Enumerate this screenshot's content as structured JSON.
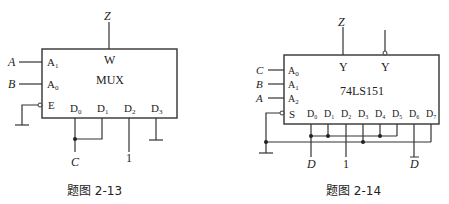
{
  "figures": [
    {
      "caption": "题图 2-13",
      "chip_label": "MUX",
      "output_pin": "W",
      "output_signal": "Z",
      "select_pins": [
        {
          "pin": "A",
          "sub": "1",
          "signal": "A"
        },
        {
          "pin": "A",
          "sub": "0",
          "signal": "B"
        }
      ],
      "enable_pin": "E",
      "data_pins": [
        {
          "pin": "D",
          "sub": "0"
        },
        {
          "pin": "D",
          "sub": "1"
        },
        {
          "pin": "D",
          "sub": "2"
        },
        {
          "pin": "D",
          "sub": "3"
        }
      ],
      "inputs": {
        "d01": "C",
        "d2": "1"
      }
    },
    {
      "caption": "题图 2-14",
      "chip_label": "74LS151",
      "output_pins": [
        "Y",
        "Y"
      ],
      "output_signal": "Z",
      "select_pins": [
        {
          "pin": "A",
          "sub": "0",
          "signal": "C"
        },
        {
          "pin": "A",
          "sub": "1",
          "signal": "B"
        },
        {
          "pin": "A",
          "sub": "2",
          "signal": "A"
        }
      ],
      "enable_pin": "S",
      "data_pins": [
        {
          "pin": "D",
          "sub": "0"
        },
        {
          "pin": "D",
          "sub": "1"
        },
        {
          "pin": "D",
          "sub": "2"
        },
        {
          "pin": "D",
          "sub": "3"
        },
        {
          "pin": "D",
          "sub": "4"
        },
        {
          "pin": "D",
          "sub": "5"
        },
        {
          "pin": "D",
          "sub": "6"
        },
        {
          "pin": "D",
          "sub": "7"
        }
      ],
      "inputs": {
        "d0": "D",
        "d2": "1",
        "d6": "D"
      }
    }
  ]
}
